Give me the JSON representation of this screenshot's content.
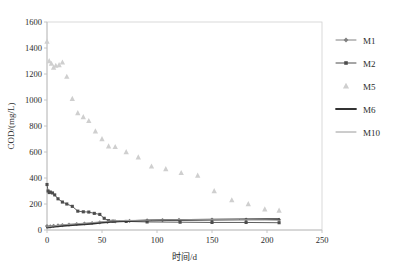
{
  "chart_data": {
    "type": "scatter",
    "title": "",
    "xlabel": "时间/d",
    "ylabel": "COD/(mg/L)",
    "xlim": [
      0,
      250
    ],
    "ylim": [
      0,
      1600
    ],
    "xticks": [
      0,
      50,
      100,
      150,
      200,
      250
    ],
    "yticks": [
      0,
      200,
      400,
      600,
      800,
      1000,
      1200,
      1400,
      1600
    ],
    "grid": false,
    "legend_position": "right",
    "series": [
      {
        "name": "M1",
        "marker": "diamond",
        "color": "#808080",
        "line": true,
        "x": [
          0,
          3,
          6,
          10,
          14,
          20,
          27,
          34,
          41,
          48,
          55,
          62,
          75,
          91,
          105,
          120,
          150,
          181,
          211
        ],
        "y": [
          30,
          28,
          32,
          35,
          38,
          42,
          46,
          50,
          54,
          58,
          62,
          66,
          70,
          74,
          76,
          78,
          80,
          80,
          78
        ]
      },
      {
        "name": "M2",
        "marker": "square",
        "color": "#4d4d4d",
        "line": true,
        "x": [
          0,
          1,
          2,
          3,
          5,
          7,
          10,
          14,
          18,
          23,
          28,
          33,
          38,
          43,
          48,
          52,
          56,
          60,
          72,
          91,
          121,
          150,
          181,
          211
        ],
        "y": [
          350,
          300,
          288,
          292,
          285,
          270,
          240,
          215,
          200,
          182,
          145,
          140,
          138,
          128,
          120,
          90,
          72,
          68,
          66,
          62,
          60,
          58,
          58,
          56
        ]
      },
      {
        "name": "M5",
        "marker": "triangle",
        "color": "#cfcfcf",
        "line": false,
        "x": [
          0,
          2,
          4,
          6,
          8,
          11,
          14,
          18,
          23,
          28,
          33,
          38,
          44,
          50,
          56,
          62,
          72,
          83,
          95,
          108,
          122,
          137,
          152,
          168,
          183,
          198,
          211
        ],
        "y": [
          1450,
          1300,
          1280,
          1250,
          1265,
          1270,
          1290,
          1180,
          1010,
          900,
          870,
          840,
          760,
          700,
          645,
          640,
          600,
          560,
          490,
          470,
          440,
          420,
          300,
          230,
          200,
          160,
          150
        ]
      },
      {
        "name": "M6",
        "marker": "none",
        "color": "#333333",
        "line": true,
        "line_width": 1.8,
        "x": [
          0,
          5,
          12,
          20,
          30,
          40,
          50,
          58,
          66,
          80,
          95,
          110,
          130,
          150,
          175,
          200,
          211
        ],
        "y": [
          18,
          24,
          30,
          36,
          42,
          48,
          56,
          62,
          66,
          70,
          74,
          76,
          78,
          80,
          82,
          84,
          84
        ]
      },
      {
        "name": "M10",
        "marker": "none",
        "color": "#9a9a9a",
        "line": true,
        "line_width": 1.0,
        "x": [
          0,
          5,
          12,
          20,
          30,
          40,
          50,
          58,
          66,
          80,
          95,
          110,
          130,
          150,
          175,
          200,
          211
        ],
        "y": [
          24,
          30,
          38,
          44,
          50,
          56,
          64,
          70,
          72,
          74,
          76,
          78,
          80,
          80,
          80,
          78,
          76
        ]
      }
    ]
  },
  "axes": {
    "y_title": "COD/(mg/L)",
    "x_title": "时间/d",
    "y_tick_labels": [
      "0",
      "200",
      "400",
      "600",
      "800",
      "1000",
      "1200",
      "1400",
      "1600"
    ],
    "x_tick_labels": [
      "0",
      "50",
      "100",
      "150",
      "200",
      "250"
    ]
  },
  "legend": {
    "entries": [
      {
        "label": "M1",
        "marker": "diamond",
        "color": "#808080",
        "line": true,
        "width": 1.0
      },
      {
        "label": "M2",
        "marker": "square",
        "color": "#4d4d4d",
        "line": true,
        "width": 1.0
      },
      {
        "label": "M5",
        "marker": "triangle",
        "color": "#cfcfcf",
        "line": false,
        "width": 0
      },
      {
        "label": "M6",
        "marker": "none",
        "color": "#333333",
        "line": true,
        "width": 1.8
      },
      {
        "label": "M10",
        "marker": "none",
        "color": "#9a9a9a",
        "line": true,
        "width": 1.0
      }
    ]
  },
  "colors": {
    "axis": "#bfbfbf",
    "plot_border": "#d0d0d0",
    "text": "#2b2b2b",
    "background": "#ffffff"
  }
}
